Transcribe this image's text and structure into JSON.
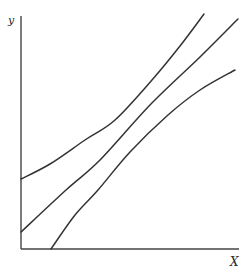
{
  "chart_data": {
    "type": "line",
    "title": "",
    "xlabel": "X",
    "ylabel": "y",
    "grid": false,
    "legend": null,
    "ticks": {
      "x": [],
      "y": []
    },
    "axis_color": "#444444",
    "line_color": "#333333",
    "series": [
      {
        "name": "upper-band",
        "description": "upper curved band line, concave-up",
        "points_px": [
          [
            21,
            179
          ],
          [
            50,
            164
          ],
          [
            85,
            140
          ],
          [
            115,
            120
          ],
          [
            152,
            80
          ],
          [
            180,
            46
          ],
          [
            204,
            14
          ]
        ]
      },
      {
        "name": "center-line",
        "description": "straight central line",
        "points_px": [
          [
            21,
            232
          ],
          [
            66,
            190
          ],
          [
            100,
            160
          ],
          [
            150,
            105
          ],
          [
            200,
            57
          ],
          [
            238,
            19
          ]
        ]
      },
      {
        "name": "lower-band",
        "description": "lower curved band line, concave-down",
        "points_px": [
          [
            51,
            249
          ],
          [
            75,
            215
          ],
          [
            98,
            190
          ],
          [
            130,
            152
          ],
          [
            168,
            115
          ],
          [
            200,
            90
          ],
          [
            235,
            70
          ]
        ]
      }
    ],
    "axes_px": {
      "origin": [
        21,
        249
      ],
      "y_top": [
        21,
        16
      ],
      "x_right": [
        239,
        249
      ]
    }
  },
  "labels": {
    "y_axis": "y",
    "x_axis": "X"
  }
}
